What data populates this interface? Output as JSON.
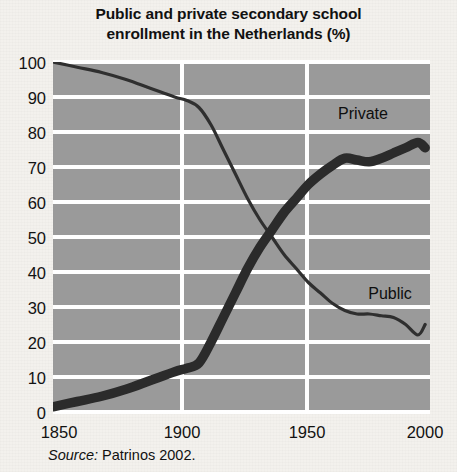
{
  "title": {
    "line1": "Public and private secondary school",
    "line2": "enrollment in the Netherlands (%)"
  },
  "source": {
    "prefix": "Source:",
    "text": "Patrinos 2002."
  },
  "labels": {
    "private": "Private",
    "public": "Public"
  },
  "colors": {
    "plot_background": "#9a9a9a",
    "gridline": "#ffffff",
    "line": "#2b2b2b",
    "page_background": "#f3f1ed",
    "text": "#111111"
  },
  "chart_data": {
    "type": "line",
    "title": "Public and private secondary school enrollment in the Netherlands (%)",
    "xlabel": "",
    "ylabel": "",
    "xlim": [
      1850,
      2005
    ],
    "ylim": [
      0,
      100
    ],
    "xticks": [
      1850,
      1900,
      1950,
      2000
    ],
    "yticks": [
      0,
      10,
      20,
      30,
      40,
      50,
      60,
      70,
      80,
      90,
      100
    ],
    "grid": true,
    "legend": "inline-annotations",
    "series": [
      {
        "name": "Public",
        "style": "thin",
        "x": [
          1850,
          1860,
          1870,
          1880,
          1890,
          1900,
          1905,
          1910,
          1915,
          1920,
          1925,
          1930,
          1935,
          1940,
          1945,
          1950,
          1955,
          1960,
          1965,
          1970,
          1975,
          1980,
          1985,
          1990,
          1995,
          2000,
          2003
        ],
        "y": [
          100,
          98.5,
          97,
          95,
          92.5,
          90,
          89,
          87,
          82,
          75,
          68,
          61,
          55,
          50,
          45,
          41,
          37,
          34,
          31,
          29,
          28,
          28,
          27.5,
          27,
          25,
          22,
          25
        ]
      },
      {
        "name": "Private",
        "style": "thick",
        "x": [
          1850,
          1860,
          1870,
          1880,
          1890,
          1900,
          1905,
          1910,
          1915,
          1920,
          1925,
          1930,
          1935,
          1940,
          1945,
          1950,
          1955,
          1960,
          1965,
          1970,
          1975,
          1980,
          1985,
          1990,
          1995,
          2000,
          2003
        ],
        "y": [
          1.5,
          3,
          4.5,
          6.5,
          9,
          11.5,
          12.5,
          14,
          20,
          27,
          34,
          41,
          47,
          52,
          57,
          61,
          65,
          68,
          70.5,
          72.5,
          72,
          71.5,
          72.5,
          74,
          75.5,
          77,
          75.5
        ]
      }
    ],
    "annotations": [
      {
        "text": "Private",
        "x": 1978,
        "y": 85
      },
      {
        "text": "Public",
        "x": 1978,
        "y": 33
      }
    ]
  }
}
